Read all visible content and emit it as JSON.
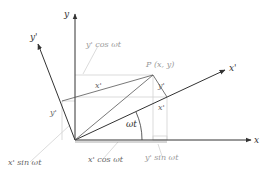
{
  "diagram": {
    "axes": {
      "x": "x",
      "y": "y",
      "x_prime": "x'",
      "y_prime": "y'"
    },
    "point_label": "P (x, y)",
    "angle_label": "ωt",
    "segment_labels": {
      "x_prime_top": "x'",
      "y_prime_left": "y'",
      "y_prime_right": "y'",
      "x_prime_right": "x'"
    },
    "projection_labels": {
      "y_prime_cos": "y' cos ωt",
      "x_prime_sin": "x' sin ωt",
      "x_prime_cos": "x' cos ωt",
      "y_prime_sin": "y' sin ωt"
    },
    "colors": {
      "axis": "#333333",
      "construction": "#555555",
      "projection": "#c8c8c8",
      "faint_text": "#9a9a9a"
    }
  }
}
